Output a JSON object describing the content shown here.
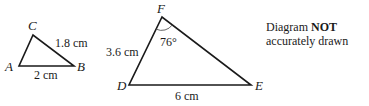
{
  "diagram": {
    "note": {
      "line1_prefix": "Diagram ",
      "line1_bold": "NOT",
      "line2": "accurately drawn"
    },
    "triangle_small": {
      "vertices": {
        "A": "A",
        "B": "B",
        "C": "C"
      },
      "sides": {
        "BC": "1.8 cm",
        "AB": "2 cm"
      }
    },
    "triangle_large": {
      "vertices": {
        "D": "D",
        "E": "E",
        "F": "F"
      },
      "sides": {
        "DF": "3.6 cm",
        "DE": "6 cm"
      },
      "angle_F": "76°"
    },
    "colors": {
      "stroke": "#1a1a1a",
      "background": "#ffffff"
    }
  }
}
